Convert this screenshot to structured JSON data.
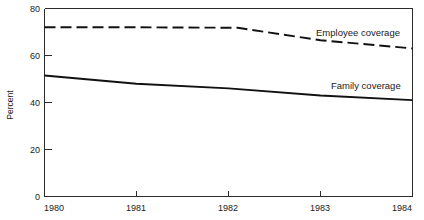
{
  "chart_data": {
    "type": "line",
    "title": "",
    "subtitle": "",
    "xlabel": "",
    "ylabel": "Percent",
    "xlim": [
      1980,
      1984
    ],
    "ylim": [
      0,
      80
    ],
    "grid": false,
    "legend_position": "inline-right",
    "x_ticks": [
      "1980",
      "1981",
      "1982",
      "1983",
      "1984"
    ],
    "x_tick_values": [
      1980,
      1981,
      1982,
      1983,
      1984
    ],
    "y_ticks": [
      "0",
      "20",
      "40",
      "60",
      "80"
    ],
    "y_tick_values": [
      0,
      20,
      40,
      60,
      80
    ],
    "series": [
      {
        "name": "Employee coverage",
        "style": "dashed",
        "color": "#111111",
        "x": [
          1980,
          1981,
          1982.1,
          1983,
          1984
        ],
        "values": [
          72.0,
          72.0,
          71.8,
          66.5,
          63.0
        ]
      },
      {
        "name": "Family coverage",
        "style": "solid",
        "color": "#111111",
        "x": [
          1980,
          1981,
          1982,
          1983,
          1984
        ],
        "values": [
          51.5,
          48.0,
          46.0,
          43.0,
          41.0
        ]
      }
    ],
    "annotations": [
      {
        "text": "Employee coverage",
        "x": 1983.0,
        "y": 69.5
      },
      {
        "text": "Family coverage",
        "x": 1983.0,
        "y": 48.0
      }
    ]
  },
  "axes": {
    "y_title": "Percent",
    "y_tick_labels": [
      "80",
      "60",
      "40",
      "20",
      "0"
    ],
    "x_tick_labels": [
      "1980",
      "1981",
      "1982",
      "1983",
      "1984"
    ]
  },
  "labels": {
    "employee": "Employee coverage",
    "family": "Family coverage"
  },
  "colors": {
    "line": "#111111",
    "frame": "#2b2b2b",
    "background": "#ffffff",
    "text": "#1a1a1a"
  }
}
